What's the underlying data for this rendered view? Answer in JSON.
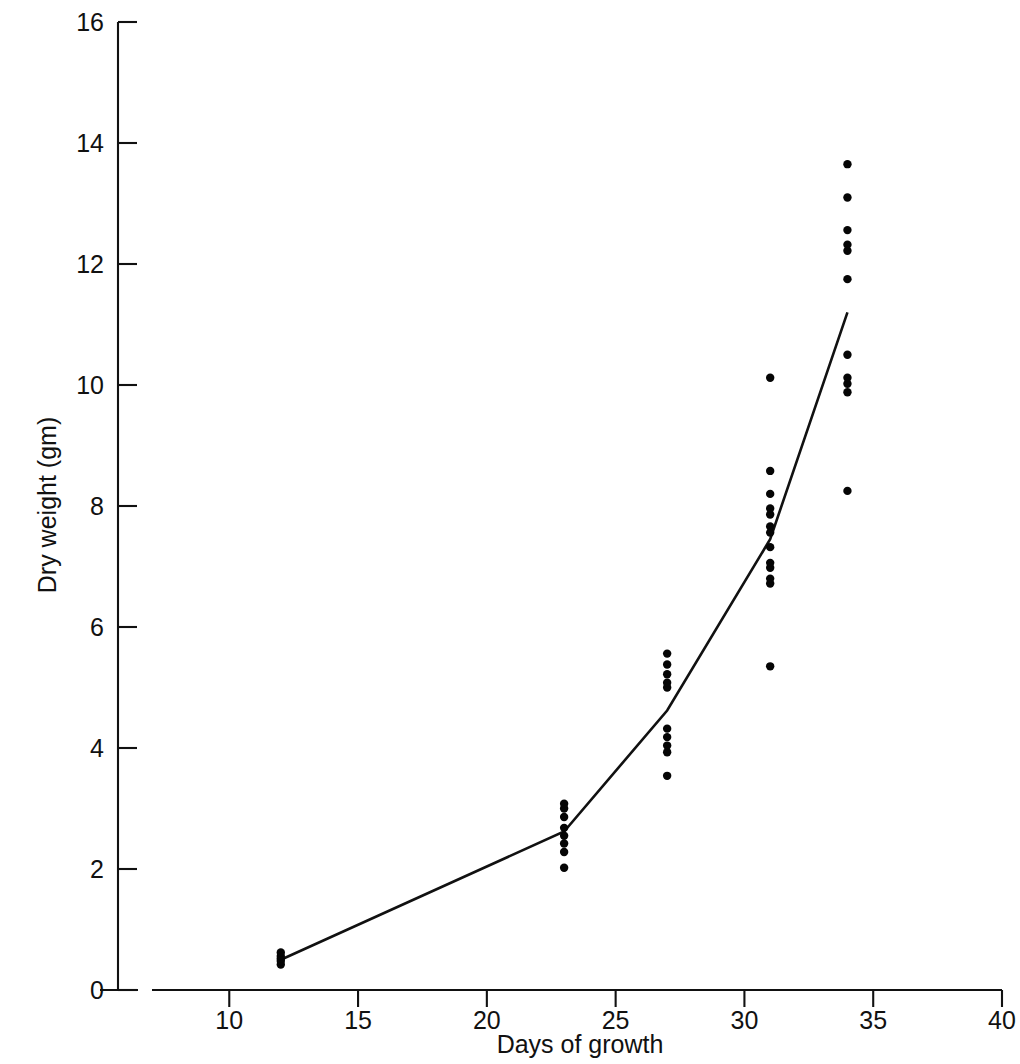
{
  "figure": {
    "clipped_top_caption": "",
    "background_color": "#ffffff",
    "ink_color": "#111111"
  },
  "chart_data": {
    "type": "scatter",
    "title": "",
    "subtitle": "",
    "xlabel": "Days of growth",
    "ylabel": "Dry weight (gm)",
    "xlim": [
      7,
      40
    ],
    "ylim": [
      0,
      16
    ],
    "xticks": [
      10,
      15,
      20,
      25,
      30,
      35,
      40
    ],
    "xticklabels": [
      "10",
      "15",
      "20",
      "25",
      "30",
      "35",
      "40"
    ],
    "yticks": [
      0,
      2,
      4,
      6,
      8,
      10,
      12,
      14,
      16
    ],
    "yticklabels": [
      "0",
      "2",
      "4",
      "6",
      "8",
      "10",
      "12",
      "14",
      "16"
    ],
    "grid": false,
    "legend": null,
    "axis_break_on_x": true,
    "marker": "filled-circle",
    "marker_size_px": 4.2,
    "series": [
      {
        "name": "Individual replicate dry weights",
        "type": "scatter",
        "points": [
          {
            "x": 12,
            "y": 0.42
          },
          {
            "x": 12,
            "y": 0.48
          },
          {
            "x": 12,
            "y": 0.52
          },
          {
            "x": 12,
            "y": 0.56
          },
          {
            "x": 12,
            "y": 0.62
          },
          {
            "x": 23,
            "y": 2.02
          },
          {
            "x": 23,
            "y": 2.28
          },
          {
            "x": 23,
            "y": 2.42
          },
          {
            "x": 23,
            "y": 2.55
          },
          {
            "x": 23,
            "y": 2.68
          },
          {
            "x": 23,
            "y": 2.86
          },
          {
            "x": 23,
            "y": 3.0
          },
          {
            "x": 23,
            "y": 3.08
          },
          {
            "x": 27,
            "y": 3.54
          },
          {
            "x": 27,
            "y": 3.93
          },
          {
            "x": 27,
            "y": 4.04
          },
          {
            "x": 27,
            "y": 4.18
          },
          {
            "x": 27,
            "y": 4.32
          },
          {
            "x": 27,
            "y": 5.0
          },
          {
            "x": 27,
            "y": 5.08
          },
          {
            "x": 27,
            "y": 5.22
          },
          {
            "x": 27,
            "y": 5.38
          },
          {
            "x": 27,
            "y": 5.56
          },
          {
            "x": 31,
            "y": 5.35
          },
          {
            "x": 31,
            "y": 6.72
          },
          {
            "x": 31,
            "y": 6.8
          },
          {
            "x": 31,
            "y": 6.98
          },
          {
            "x": 31,
            "y": 7.06
          },
          {
            "x": 31,
            "y": 7.32
          },
          {
            "x": 31,
            "y": 7.56
          },
          {
            "x": 31,
            "y": 7.66
          },
          {
            "x": 31,
            "y": 7.86
          },
          {
            "x": 31,
            "y": 7.96
          },
          {
            "x": 31,
            "y": 8.2
          },
          {
            "x": 31,
            "y": 8.58
          },
          {
            "x": 31,
            "y": 10.12
          },
          {
            "x": 34,
            "y": 8.25
          },
          {
            "x": 34,
            "y": 9.88
          },
          {
            "x": 34,
            "y": 10.02
          },
          {
            "x": 34,
            "y": 10.12
          },
          {
            "x": 34,
            "y": 10.5
          },
          {
            "x": 34,
            "y": 11.75
          },
          {
            "x": 34,
            "y": 12.22
          },
          {
            "x": 34,
            "y": 12.32
          },
          {
            "x": 34,
            "y": 12.56
          },
          {
            "x": 34,
            "y": 13.1
          },
          {
            "x": 34,
            "y": 13.65
          }
        ]
      },
      {
        "name": "Mean dry weight",
        "type": "line",
        "x": [
          12,
          23,
          27,
          31,
          34
        ],
        "values": [
          0.5,
          2.62,
          4.62,
          7.45,
          11.2
        ]
      }
    ]
  }
}
